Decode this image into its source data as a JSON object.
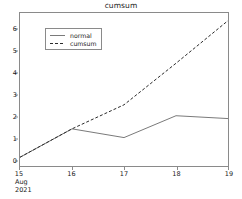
{
  "chart_data": {
    "type": "line",
    "title": "cumsum",
    "xlabel": "",
    "ylabel": "",
    "x": [
      "15",
      "16",
      "17",
      "18",
      "19"
    ],
    "x_tick_labels": [
      "15",
      "16",
      "17",
      "18",
      "19"
    ],
    "x_axis_sublabels": [
      "Aug",
      "2021"
    ],
    "y_tick_labels": [
      "0",
      "1",
      "2",
      "3",
      "4",
      "5",
      "6"
    ],
    "y_ticks": [
      0,
      1,
      2,
      3,
      4,
      5,
      6
    ],
    "ylim": [
      -0.25,
      6.75
    ],
    "xlim": [
      15,
      19
    ],
    "grid": false,
    "legend_position": "upper left",
    "series": [
      {
        "name": "normal",
        "style": "solid",
        "color": "#7a7a7a",
        "values": [
          0.15,
          1.45,
          1.05,
          2.05,
          1.92
        ]
      },
      {
        "name": "cumsum",
        "style": "dashed",
        "color": "#2b2b2b",
        "values": [
          0.15,
          1.45,
          2.55,
          4.45,
          6.4
        ]
      }
    ]
  },
  "legend": {
    "items": [
      {
        "label": "normal"
      },
      {
        "label": "cumsum"
      }
    ]
  },
  "colors": {
    "normal_line": "#7a7a7a",
    "cumsum_line": "#2b2b2b",
    "axis": "#8a8a8a",
    "text": "#1a1a1a",
    "background": "#ffffff"
  }
}
